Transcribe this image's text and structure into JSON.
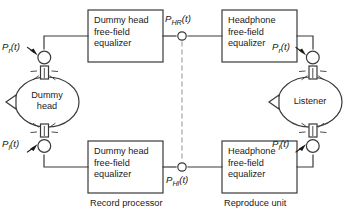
{
  "diagram": {
    "colors": {
      "stroke": "#3a3a3a",
      "text": "#1a1a1a",
      "background": "#ffffff",
      "dashed": "#8a8a8a"
    },
    "blocks": [
      {
        "id": "dummy-head-eq-right",
        "lines": [
          "Dummy head",
          "free-field",
          "equalizer"
        ]
      },
      {
        "id": "headphone-eq-right",
        "lines": [
          "Headphone",
          "free-field",
          "equalizer"
        ]
      },
      {
        "id": "dummy-head-eq-left",
        "lines": [
          "Dummy head",
          "free-field",
          "equalizer"
        ]
      },
      {
        "id": "headphone-eq-left",
        "lines": [
          "Headphone",
          "free-field",
          "equalizer"
        ]
      }
    ],
    "heads": {
      "dummy": {
        "line1": "Dummy",
        "line2": "head"
      },
      "listener": {
        "line1": "Listener",
        "line2": ""
      }
    },
    "signals": {
      "source_right": {
        "base": "P",
        "sub": "r",
        "arg": "(t)"
      },
      "source_left": {
        "base": "P",
        "sub": "l",
        "arg": "(t)"
      },
      "mid_right": {
        "base": "P",
        "sub": "HR",
        "arg": "(t)"
      },
      "mid_left": {
        "base": "P",
        "sub": "Hl",
        "arg": "(t)"
      },
      "out_right": {
        "base": "P",
        "sub": "r",
        "arg": "(t)"
      },
      "out_left": {
        "base": "P",
        "sub": "l",
        "arg": "(t)"
      }
    },
    "captions": {
      "record": "Record processor",
      "reproduce": "Reproduce unit"
    }
  }
}
